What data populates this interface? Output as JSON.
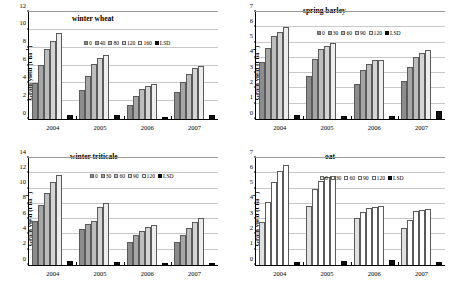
{
  "figure": {
    "ylabel": "Grain yield (t ha",
    "ylabel_sup": "-1",
    "ylabel_close": ")",
    "years": [
      "2004",
      "2005",
      "2006",
      "2007"
    ]
  },
  "chart_data": [
    {
      "type": "bar",
      "title": "winter wheat",
      "xlabel": "",
      "ylabel": "Grain yield (t ha-1)",
      "ylim": [
        0,
        12
      ],
      "yticks": [
        0,
        2,
        4,
        6,
        8,
        10,
        12
      ],
      "grid": true,
      "legend_position": "upper center",
      "categories": [
        "2004",
        "2005",
        "2006",
        "2007"
      ],
      "legend": [
        "0",
        "40",
        "80",
        "120",
        "160",
        "LSD"
      ],
      "series": [
        {
          "name": "0",
          "values": [
            4.0,
            3.3,
            1.6,
            3.05
          ]
        },
        {
          "name": "40",
          "values": [
            6.1,
            4.85,
            2.6,
            4.2
          ]
        },
        {
          "name": "80",
          "values": [
            7.8,
            6.2,
            3.35,
            5.1
          ]
        },
        {
          "name": "120",
          "values": [
            8.8,
            6.8,
            3.7,
            5.7
          ]
        },
        {
          "name": "160",
          "values": [
            9.7,
            7.15,
            3.9,
            5.9
          ]
        },
        {
          "name": "LSD",
          "values": [
            0.42,
            0.4,
            0.25,
            0.45
          ]
        }
      ]
    },
    {
      "type": "bar",
      "title": "spring barley",
      "xlabel": "",
      "ylabel": "Grain yield (t ha-1)",
      "ylim": [
        0,
        7
      ],
      "yticks": [
        0,
        1,
        2,
        3,
        4,
        5,
        6,
        7
      ],
      "grid": true,
      "legend_position": "upper center",
      "categories": [
        "2004",
        "2005",
        "2006",
        "2007"
      ],
      "legend": [
        "0",
        "30",
        "60",
        "90",
        "120",
        "LSD"
      ],
      "series": [
        {
          "name": "0",
          "values": [
            3.7,
            2.8,
            2.3,
            2.5
          ]
        },
        {
          "name": "30",
          "values": [
            4.65,
            3.9,
            3.2,
            3.4
          ]
        },
        {
          "name": "60",
          "values": [
            5.45,
            4.55,
            3.6,
            4.05
          ]
        },
        {
          "name": "90",
          "values": [
            5.7,
            4.75,
            3.85,
            4.35
          ]
        },
        {
          "name": "120",
          "values": [
            6.05,
            4.95,
            3.85,
            4.5
          ]
        },
        {
          "name": "LSD",
          "values": [
            0.25,
            0.2,
            0.22,
            0.52
          ]
        }
      ]
    },
    {
      "type": "bar",
      "title": "winter triticale",
      "xlabel": "",
      "ylabel": "Grain yield (t ha-1)",
      "ylim": [
        0,
        14
      ],
      "yticks": [
        0,
        2,
        4,
        6,
        8,
        10,
        12,
        14
      ],
      "grid": true,
      "legend_position": "upper center",
      "categories": [
        "2004",
        "2005",
        "2006",
        "2007"
      ],
      "legend": [
        "0",
        "30",
        "60",
        "90",
        "120",
        "LSD"
      ],
      "series": [
        {
          "name": "0",
          "values": [
            5.8,
            4.65,
            2.95,
            2.95
          ]
        },
        {
          "name": "30",
          "values": [
            7.8,
            5.4,
            3.95,
            3.95
          ]
        },
        {
          "name": "60",
          "values": [
            9.4,
            5.8,
            4.5,
            4.8
          ]
        },
        {
          "name": "90",
          "values": [
            10.8,
            7.6,
            5.0,
            5.65
          ]
        },
        {
          "name": "120",
          "values": [
            11.8,
            8.05,
            5.25,
            6.1
          ]
        },
        {
          "name": "LSD",
          "values": [
            0.5,
            0.35,
            0.3,
            0.3
          ]
        }
      ]
    },
    {
      "type": "bar",
      "title": "oat",
      "xlabel": "",
      "ylabel": "Grain yield (t ha-1)",
      "ylim": [
        0,
        7
      ],
      "yticks": [
        0,
        1,
        2,
        3,
        4,
        5,
        6,
        7
      ],
      "grid": true,
      "legend_position": "upper center",
      "categories": [
        "2004",
        "2005",
        "2006",
        "2007"
      ],
      "legend": [
        "0",
        "30",
        "60",
        "90",
        "120",
        "LSD"
      ],
      "series": [
        {
          "name": "0",
          "values": [
            2.8,
            3.85,
            3.1,
            2.4
          ]
        },
        {
          "name": "30",
          "values": [
            4.1,
            5.0,
            3.5,
            2.95
          ]
        },
        {
          "name": "60",
          "values": [
            5.45,
            5.5,
            3.75,
            3.55
          ]
        },
        {
          "name": "90",
          "values": [
            6.15,
            5.75,
            3.78,
            3.6
          ]
        },
        {
          "name": "120",
          "values": [
            6.55,
            5.85,
            3.88,
            3.68
          ]
        },
        {
          "name": "LSD",
          "values": [
            0.22,
            0.25,
            0.3,
            0.18
          ]
        }
      ]
    }
  ],
  "styles": {
    "fills": {
      "dark": [
        "#8c8c8c",
        "#a6a6a6",
        "#bdbdbd",
        "#d4d4d4",
        "#ededed"
      ],
      "light": [
        "#e0e0e0",
        "#ffffff",
        "#ffffff",
        "#ffffff",
        "#ffffff"
      ]
    },
    "lsd_color": "#111111",
    "grid_color": "#c8c8c8",
    "axis_color": "#000000"
  },
  "panel_layout": [
    {
      "key": "winter-wheat",
      "palette": "dark",
      "title_left": 72,
      "title_top": 14,
      "legend_left": 84,
      "legend_top": 40
    },
    {
      "key": "spring-barley",
      "palette": "dark",
      "title_left": 76,
      "title_top": 6,
      "legend_left": 90,
      "legend_top": 30
    },
    {
      "key": "winter-triticale",
      "palette": "dark",
      "title_left": 70,
      "title_top": 6,
      "legend_left": 90,
      "legend_top": 27
    },
    {
      "key": "oat",
      "palette": "light",
      "title_left": 98,
      "title_top": 6,
      "legend_left": 93,
      "legend_top": 29
    }
  ]
}
